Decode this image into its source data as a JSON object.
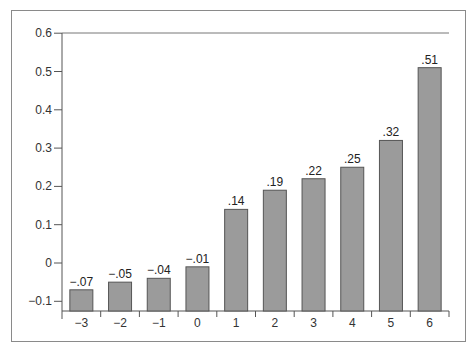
{
  "chart_data": {
    "type": "bar",
    "title": "",
    "xlabel": "",
    "ylabel": "",
    "categories": [
      "-3",
      "-2",
      "-1",
      "0",
      "1",
      "2",
      "3",
      "4",
      "5",
      "6"
    ],
    "category_labels": [
      "−3",
      "−2",
      "−1",
      "0",
      "1",
      "2",
      "3",
      "4",
      "5",
      "6"
    ],
    "values": [
      -0.07,
      -0.05,
      -0.04,
      -0.01,
      0.14,
      0.19,
      0.22,
      0.25,
      0.32,
      0.51
    ],
    "value_labels": [
      "−.07",
      "−.05",
      "−.04",
      "−.01",
      ".14",
      ".19",
      ".22",
      ".25",
      ".32",
      ".51"
    ],
    "yticks": [
      -0.1,
      0,
      0.1,
      0.2,
      0.3,
      0.4,
      0.5,
      0.6
    ],
    "ytick_labels": [
      "−0.1",
      "0",
      "0.1",
      "0.2",
      "0.3",
      "0.4",
      "0.5",
      "0.6"
    ],
    "ylim": [
      -0.127,
      0.6
    ],
    "grid": false,
    "legend": null,
    "bar_color": "#9b9b9b",
    "bar_edge_color": "#555555"
  }
}
